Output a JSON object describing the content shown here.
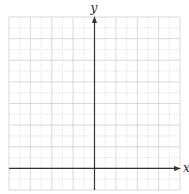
{
  "diagram": {
    "type": "coordinate-grid",
    "axes": {
      "x_label": "x",
      "y_label": "y"
    },
    "grid": {
      "columns": 16,
      "rows": 16,
      "left": 9,
      "top": 17,
      "right": 180,
      "bottom": 190,
      "y_axis_col": 8,
      "x_axis_row": 14
    },
    "colors": {
      "grid": "#cfcfcf",
      "axis": "#333333",
      "background": "#ffffff"
    }
  }
}
